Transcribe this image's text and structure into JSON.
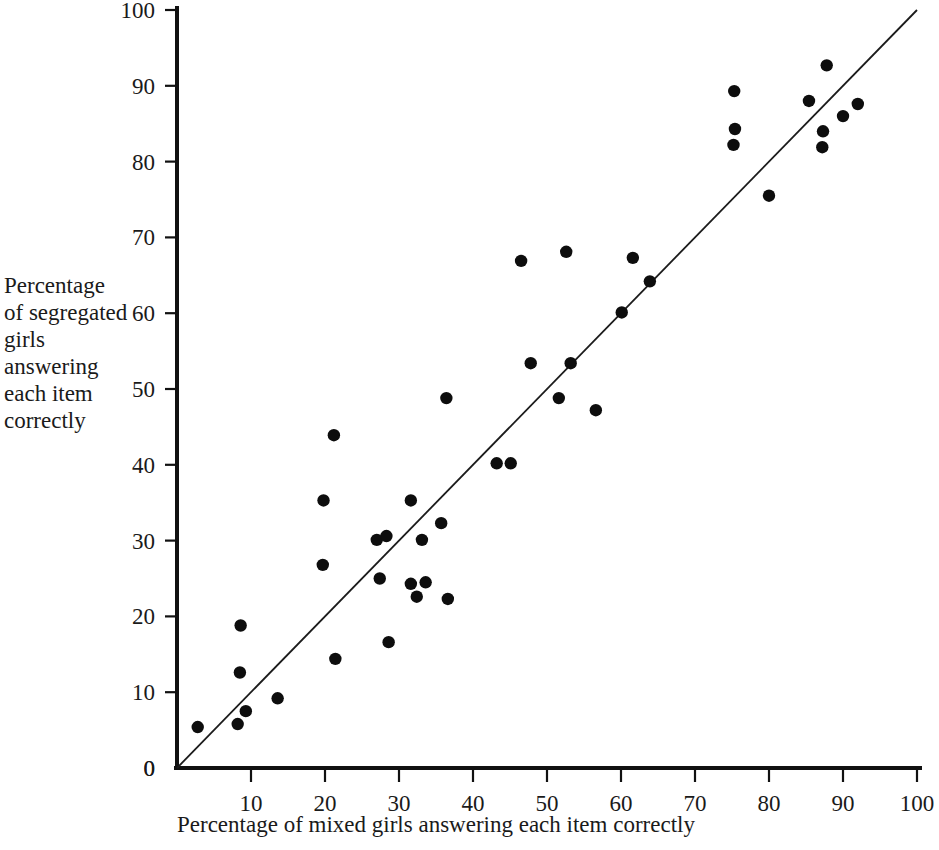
{
  "chart_data": {
    "type": "scatter",
    "title": "",
    "xlabel": "Percentage of mixed girls answering each item correctly",
    "ylabel": "Percentage\nof segregated\ngirls\nanswering\neach item\ncorrectly",
    "xlim": [
      0,
      100
    ],
    "ylim": [
      0,
      100
    ],
    "xticks": [
      0,
      10,
      20,
      30,
      40,
      50,
      60,
      70,
      80,
      90,
      100
    ],
    "yticks": [
      0,
      10,
      20,
      30,
      40,
      50,
      60,
      70,
      80,
      90,
      100
    ],
    "grid": false,
    "legend": null,
    "marker": "filled-circle",
    "marker_color": "#0d0d0d",
    "annotations": [
      {
        "name": "identity-reference-line",
        "description": "Straight line from origin (0,0) to (100,100)",
        "from": [
          0,
          0
        ],
        "to": [
          100,
          100
        ]
      }
    ],
    "points": [
      [
        2.8,
        5.4
      ],
      [
        8.2,
        5.8
      ],
      [
        9.3,
        7.5
      ],
      [
        8.5,
        12.6
      ],
      [
        8.6,
        18.8
      ],
      [
        13.6,
        9.2
      ],
      [
        19.7,
        26.8
      ],
      [
        19.8,
        35.3
      ],
      [
        21.2,
        43.9
      ],
      [
        21.4,
        14.4
      ],
      [
        27.0,
        30.1
      ],
      [
        27.4,
        25.0
      ],
      [
        28.3,
        30.6
      ],
      [
        28.6,
        16.6
      ],
      [
        31.6,
        35.3
      ],
      [
        31.6,
        24.3
      ],
      [
        32.4,
        22.6
      ],
      [
        33.1,
        30.1
      ],
      [
        33.6,
        24.5
      ],
      [
        35.7,
        32.3
      ],
      [
        36.4,
        48.8
      ],
      [
        36.6,
        22.3
      ],
      [
        43.2,
        40.2
      ],
      [
        45.1,
        40.2
      ],
      [
        46.5,
        66.9
      ],
      [
        47.8,
        53.4
      ],
      [
        51.6,
        48.8
      ],
      [
        52.6,
        68.1
      ],
      [
        53.2,
        53.4
      ],
      [
        56.6,
        47.2
      ],
      [
        60.1,
        60.1
      ],
      [
        61.6,
        67.3
      ],
      [
        63.9,
        64.2
      ],
      [
        75.3,
        89.3
      ],
      [
        75.4,
        84.3
      ],
      [
        75.2,
        82.2
      ],
      [
        80.0,
        75.5
      ],
      [
        85.4,
        88.0
      ],
      [
        87.8,
        92.7
      ],
      [
        87.3,
        84.0
      ],
      [
        87.2,
        81.9
      ],
      [
        90.0,
        86.0
      ],
      [
        92.0,
        87.6
      ]
    ]
  },
  "axes": {
    "x_tick_labels": [
      "0",
      "10",
      "20",
      "30",
      "40",
      "50",
      "60",
      "70",
      "80",
      "90",
      "100"
    ],
    "y_tick_labels": [
      "0",
      "10",
      "20",
      "30",
      "40",
      "50",
      "60",
      "70",
      "80",
      "90",
      "100"
    ],
    "x_axis_title": "Percentage of mixed girls answering each item correctly",
    "y_axis_title_lines": [
      "Percentage",
      "of segregated",
      "girls",
      "answering",
      "each item",
      "correctly"
    ]
  },
  "colors": {
    "axis": "#111111",
    "marker": "#0d0d0d",
    "reference_line": "#1b1b1b",
    "background": "#ffffff",
    "text": "#1a1a1a"
  }
}
